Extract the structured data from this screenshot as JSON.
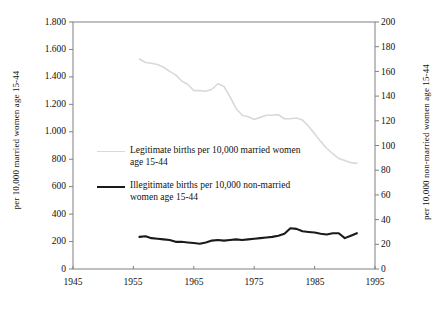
{
  "chart_data": {
    "type": "line",
    "title": "",
    "subtitle": "",
    "xlabel": "",
    "ylabel": "per 10,000 married women age 15-44",
    "ylabel_right": "per 10,000 non-married women age 15-44",
    "xlim": [
      1945,
      1995
    ],
    "ylim": [
      0,
      1800
    ],
    "ylim_right": [
      0,
      200
    ],
    "grid": false,
    "legend_position": "inside-left-middle",
    "xticks": [
      1945,
      1955,
      1965,
      1975,
      1985,
      1995
    ],
    "xticklabels": [
      "1945",
      "1955",
      "1965",
      "1975",
      "1985",
      "1995"
    ],
    "yticks_left": [
      0,
      200,
      400,
      600,
      800,
      1000,
      1200,
      1400,
      1600,
      1800
    ],
    "yticklabels_left": [
      "0",
      "200",
      "400",
      "600",
      "800",
      "1.000",
      "1.200",
      "1.400",
      "1.600",
      "1.800"
    ],
    "yticks_right": [
      0,
      20,
      40,
      60,
      80,
      100,
      120,
      140,
      160,
      180,
      200
    ],
    "yticklabels_right": [
      "0",
      "20",
      "40",
      "60",
      "80",
      "100",
      "120",
      "140",
      "160",
      "180",
      "200"
    ],
    "series": [
      {
        "name": "Legitimate births per 10,000 married women age 15-44",
        "axis": "left",
        "color": "#d9d9d9",
        "width": 1.6,
        "x": [
          1956,
          1957,
          1958,
          1959,
          1960,
          1961,
          1962,
          1963,
          1964,
          1965,
          1966,
          1967,
          1968,
          1969,
          1970,
          1971,
          1972,
          1973,
          1974,
          1975,
          1976,
          1977,
          1978,
          1979,
          1980,
          1981,
          1982,
          1983,
          1984,
          1985,
          1986,
          1987,
          1988,
          1989,
          1990,
          1991,
          1992
        ],
        "values": [
          1530,
          1505,
          1500,
          1490,
          1470,
          1440,
          1415,
          1370,
          1345,
          1300,
          1300,
          1295,
          1310,
          1350,
          1330,
          1255,
          1170,
          1120,
          1110,
          1090,
          1105,
          1120,
          1120,
          1125,
          1095,
          1095,
          1100,
          1085,
          1040,
          985,
          930,
          880,
          840,
          805,
          790,
          775,
          770
        ]
      },
      {
        "name": "Illegitimate births per 10,000 non-married women age 15-44",
        "axis": "right",
        "color": "#1a1a1a",
        "width": 2.1,
        "x": [
          1956,
          1957,
          1958,
          1959,
          1960,
          1961,
          1962,
          1963,
          1964,
          1965,
          1966,
          1967,
          1968,
          1969,
          1970,
          1971,
          1972,
          1973,
          1974,
          1975,
          1976,
          1977,
          1978,
          1979,
          1980,
          1981,
          1982,
          1983,
          1984,
          1985,
          1986,
          1987,
          1988,
          1989,
          1990,
          1991,
          1992
        ],
        "values": [
          26,
          26.5,
          25,
          24.5,
          24,
          23.5,
          22,
          22,
          21.5,
          21,
          20.5,
          21.5,
          23,
          23.5,
          23,
          23.5,
          24,
          23.5,
          24,
          24.5,
          25,
          25.5,
          26,
          27,
          28.5,
          33,
          32.5,
          30.5,
          30,
          29.5,
          28.5,
          28,
          29,
          29,
          25,
          27,
          29
        ]
      }
    ]
  },
  "legend": {
    "entries": [
      {
        "marker": "light-gray-line",
        "line1": "Legitimate births per 10,000 married women",
        "line2": "age 15-44"
      },
      {
        "marker": "black-line",
        "line1": "Illegitimate births per 10,000 non-married",
        "line2": "women age 15-44"
      }
    ]
  },
  "colors": {
    "legitimate_line": "#d9d9d9",
    "illegitimate_line": "#1a1a1a",
    "axis": "#808080",
    "text": "#111111"
  }
}
